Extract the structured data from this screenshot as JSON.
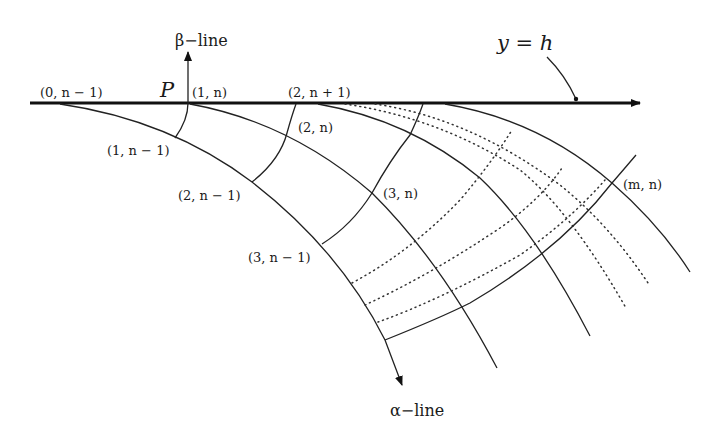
{
  "figure": {
    "boundary_label": "y = h",
    "beta_line_label": "β−line",
    "alpha_line_label": "α−line",
    "point_label": "P",
    "node_labels": {
      "n0_nm1": "(0, n − 1)",
      "n1_n": "(1, n)",
      "n2_np1": "(2, n + 1)",
      "n1_nm1": "(1, n − 1)",
      "n2_n": "(2, n)",
      "n2_nm1": "(2, n − 1)",
      "n3_n": "(3, n)",
      "n3_nm1": "(3, n − 1)",
      "nm_n": "(m, n)"
    },
    "colors": {
      "line": "#222222",
      "background": "#ffffff"
    }
  }
}
